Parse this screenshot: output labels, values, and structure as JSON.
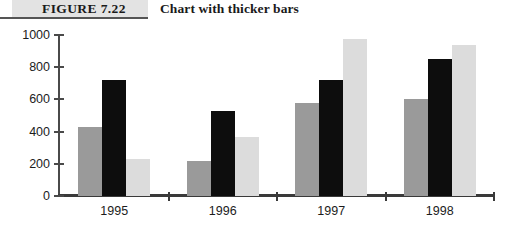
{
  "figure": {
    "tag": "FIGURE 7.22",
    "title": "Chart with thicker bars"
  },
  "chart_data": {
    "type": "bar",
    "title": "Chart with thicker bars",
    "xlabel": "",
    "ylabel": "",
    "categories": [
      "1995",
      "1996",
      "1997",
      "1998"
    ],
    "yticks": [
      0,
      200,
      400,
      600,
      800,
      1000
    ],
    "ylim": [
      0,
      1000
    ],
    "grid": false,
    "legend": "none",
    "series": [
      {
        "name": "Series 1",
        "color": "#9a9a9a",
        "values": [
          430,
          215,
          580,
          600
        ]
      },
      {
        "name": "Series 2",
        "color": "#0d0d0d",
        "values": [
          720,
          530,
          722,
          852
        ]
      },
      {
        "name": "Series 3",
        "color": "#dcdcdc",
        "values": [
          228,
          365,
          975,
          938
        ]
      }
    ]
  }
}
